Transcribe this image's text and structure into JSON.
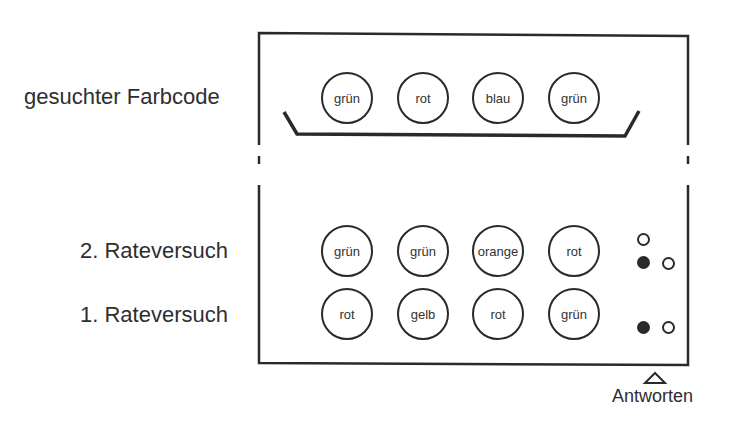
{
  "labels": {
    "secret_code": "gesuchter Farbcode",
    "guess_2": "2. Rateversuch",
    "guess_1": "1. Rateversuch",
    "answers": "Antworten"
  },
  "secret_code": [
    "grün",
    "rot",
    "blau",
    "grün"
  ],
  "guesses": [
    {
      "label": "2. Rateversuch",
      "pegs": [
        "grün",
        "grün",
        "orange",
        "rot"
      ],
      "feedback": {
        "black": 1,
        "white": 2
      }
    },
    {
      "label": "1. Rateversuch",
      "pegs": [
        "rot",
        "gelb",
        "rot",
        "grün"
      ],
      "feedback": {
        "black": 1,
        "white": 1
      }
    }
  ],
  "colors": {
    "stroke": "#2a2a2a",
    "background": "#ffffff"
  }
}
